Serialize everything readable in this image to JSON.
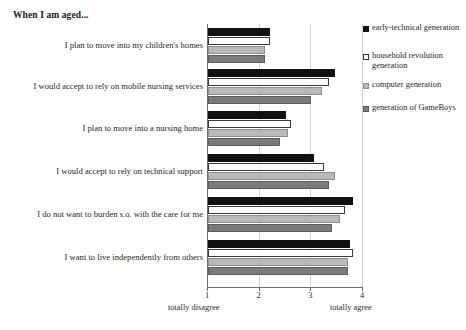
{
  "chart_data": {
    "type": "bar",
    "orientation": "horizontal",
    "title": "When I am aged...",
    "xlabel": "",
    "ylabel": "",
    "xlim": [
      1,
      4
    ],
    "xticks": [
      "1",
      "2",
      "3",
      "4"
    ],
    "axis_low_label": "totally disagree",
    "axis_high_label": "totally agree",
    "grid": true,
    "legend_position": "right",
    "categories": [
      "I plan to move into my children's homes",
      "I would accept to rely on mobile nursing services",
      "I plan to move into a nursing home",
      "I would accept to rely on technical support",
      "I do not want to burden s.o. with the care for me",
      "I want to live independently from others"
    ],
    "series": [
      {
        "name": "early-technical generation",
        "color": "#111111",
        "values": [
          2.2,
          3.45,
          2.5,
          3.05,
          3.8,
          3.75
        ]
      },
      {
        "name": "household revolution generation",
        "color": "#ffffff",
        "values": [
          2.2,
          3.35,
          2.6,
          3.25,
          3.65,
          3.8
        ]
      },
      {
        "name": "computer generation",
        "color": "#b9b9b9",
        "values": [
          2.1,
          3.2,
          2.55,
          3.45,
          3.55,
          3.7
        ]
      },
      {
        "name": "generation of GameBoys",
        "color": "#7b7b7b",
        "values": [
          2.1,
          3.0,
          2.4,
          3.35,
          3.4,
          3.7
        ]
      }
    ]
  },
  "legend": {
    "items": [
      {
        "label": "early-technical generation"
      },
      {
        "label": "household revolution generation"
      },
      {
        "label": "computer generation"
      },
      {
        "label": "generation of GameBoys"
      }
    ]
  }
}
